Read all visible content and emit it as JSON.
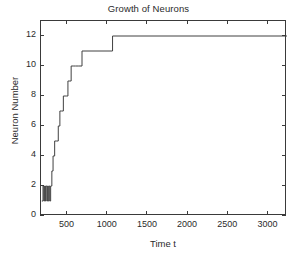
{
  "chart_data": {
    "type": "line",
    "title": "Growth of Neurons",
    "xlabel": "Time t",
    "ylabel": "Neuron Number",
    "xlim": [
      170,
      3230
    ],
    "ylim": [
      0,
      13
    ],
    "grid": false,
    "legend": null,
    "xticks": [
      500,
      1000,
      1500,
      2000,
      2500,
      3000
    ],
    "xtick_labels": [
      "500",
      "1000",
      "1500",
      "2000",
      "2500",
      "3000"
    ],
    "yticks": [
      0,
      2,
      4,
      6,
      8,
      10,
      12
    ],
    "ytick_labels": [
      "0",
      "2",
      "4",
      "6",
      "8",
      "10",
      "12"
    ],
    "line_color": "#404040",
    "background_color": "#ffffff",
    "axis_color": "#3a3a3a",
    "series": [
      {
        "name": "Neuron Number",
        "drawstyle": "steps-post",
        "x": [
          180,
          195,
          205,
          215,
          225,
          235,
          250,
          265,
          278,
          290,
          305,
          320,
          340,
          360,
          385,
          405,
          425,
          448,
          470,
          490,
          505,
          520,
          545,
          570,
          600,
          640,
          680,
          1060,
          3230
        ],
        "y": [
          1,
          2,
          1,
          2,
          1,
          2,
          1,
          2,
          1,
          2,
          3,
          4,
          5,
          5,
          6,
          7,
          7,
          8,
          8,
          8,
          9,
          9,
          10,
          10,
          10,
          10,
          11,
          12,
          12
        ]
      }
    ]
  }
}
